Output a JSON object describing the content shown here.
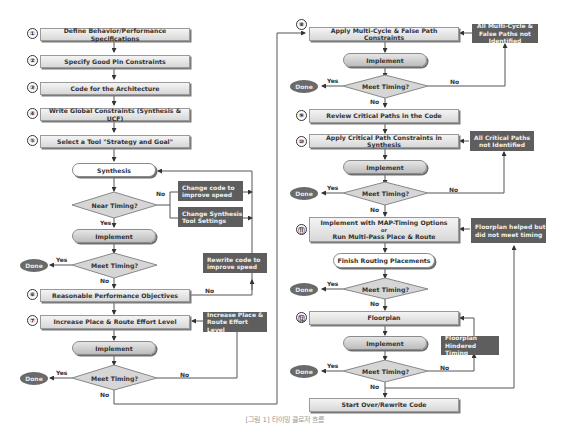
{
  "diagram": {
    "colors": {
      "box_fill": "#e6e6e6",
      "dark_fill": "#5e5e5e",
      "line": "#555555",
      "done_fill": "#6a6a6a"
    },
    "left_column": {
      "steps": [
        {
          "num": "①",
          "label": "Define Behavior/Performance Specifications"
        },
        {
          "num": "②",
          "label": "Specify Good Pin Constraints"
        },
        {
          "num": "③",
          "label": "Code for the Architecture"
        },
        {
          "num": "④",
          "label": "Write Global Constraints (Synthesis & UCF)"
        },
        {
          "num": "⑤",
          "label": "Select a Tool \"Strategy and Goal\""
        }
      ],
      "synthesis": "Synthesis",
      "near_timing": "Near Timing?",
      "change_code": "Change code to improve speed",
      "change_synth": "Change Synthesis Tool Settings",
      "implement1": "Implement",
      "meet_timing1": "Meet Timing?",
      "rewrite_code": "Rewrite code to improve speed",
      "step6": {
        "num": "⑥",
        "label": "Reasonable Performance Objectives"
      },
      "step7": {
        "num": "⑦",
        "label": "Increase Place & Route Effort Level"
      },
      "increase_pr": "Increase Place & Route Effort Level",
      "implement2": "Implement",
      "meet_timing2": "Meet Timing?"
    },
    "right_column": {
      "step8": {
        "num": "⑧",
        "label": "Apply Multi-Cycle & False Path Constraints"
      },
      "all_multi": "All Multi-Cycle & False Paths not Identified",
      "implement3": "Implement",
      "meet_timing3": "Meet Timing?",
      "step9": {
        "num": "⑨",
        "label": "Review Critical Paths in the Code"
      },
      "step10": {
        "num": "⑩",
        "label": "Apply Critical Path Constraints in Synthesis"
      },
      "all_critical": "All Critical Paths not Identified",
      "implement4": "Implement",
      "meet_timing4": "Meet Timing?",
      "step11": {
        "num": "⑪",
        "line1": "Implement with MAP-Timing Options",
        "line2": "or",
        "line3": "Run Multi-Pass Place & Route"
      },
      "floorplan_helped": "Floorplan helped but did not meet timing",
      "finish_routing": "Finish Routing Placements",
      "meet_timing5": "Meet Timing?",
      "step12": {
        "num": "⑫",
        "label": "Floorplan"
      },
      "floorplan_hindered": "Floorplan Hindered Timing",
      "implement5": "Implement",
      "meet_timing6": "Meet Timing?",
      "start_over": "Start Over/Rewrite Code"
    },
    "labels": {
      "yes": "Yes",
      "no": "No",
      "done": "Done"
    },
    "caption": "[그림 1] 타이밍 클로저 흐름"
  }
}
